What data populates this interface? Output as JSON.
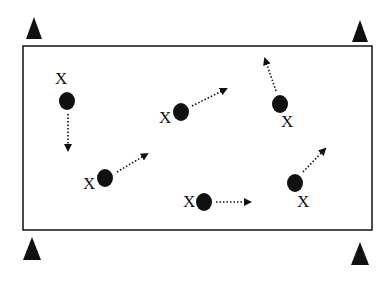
{
  "diagram": {
    "type": "drill-layout",
    "colors": {
      "ink": "#111111",
      "background": "#ffffff"
    },
    "field": {
      "x": 23,
      "y": 46,
      "width": 349,
      "height": 184
    },
    "cones": [
      {
        "id": "cone-top-left",
        "cx": 34,
        "top": 17,
        "bottom": 39,
        "half_width": 8
      },
      {
        "id": "cone-top-right",
        "cx": 360,
        "top": 20,
        "bottom": 42,
        "half_width": 8
      },
      {
        "id": "cone-bottom-left",
        "cx": 32,
        "top": 237,
        "bottom": 260,
        "half_width": 9
      },
      {
        "id": "cone-bottom-right",
        "cx": 360,
        "top": 242,
        "bottom": 265,
        "half_width": 9
      }
    ],
    "players": [
      {
        "label": "X",
        "label_x": 55,
        "label_y": 84,
        "dot_cx": 67,
        "dot_cy": 101,
        "arrow_from": [
          68,
          114
        ],
        "arrow_to": [
          68,
          150
        ]
      },
      {
        "label": "X",
        "label_x": 159,
        "label_y": 123,
        "dot_cx": 181,
        "dot_cy": 112,
        "arrow_from": [
          192,
          106
        ],
        "arrow_to": [
          226,
          89
        ]
      },
      {
        "label": "X",
        "label_x": 281,
        "label_y": 127,
        "dot_cx": 280,
        "dot_cy": 104,
        "arrow_from": [
          276,
          91
        ],
        "arrow_to": [
          265,
          59
        ]
      },
      {
        "label": "X",
        "label_x": 83,
        "label_y": 189,
        "dot_cx": 105,
        "dot_cy": 178,
        "arrow_from": [
          117,
          172
        ],
        "arrow_to": [
          147,
          154
        ]
      },
      {
        "label": "X",
        "label_x": 183,
        "label_y": 207,
        "dot_cx": 204,
        "dot_cy": 202,
        "arrow_from": [
          216,
          202
        ],
        "arrow_to": [
          250,
          202
        ]
      },
      {
        "label": "X",
        "label_x": 297,
        "label_y": 207,
        "dot_cx": 295,
        "dot_cy": 183,
        "arrow_from": [
          303,
          172
        ],
        "arrow_to": [
          325,
          149
        ]
      }
    ]
  }
}
